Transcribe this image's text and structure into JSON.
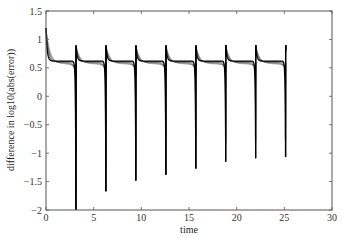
{
  "chart_data": {
    "type": "line",
    "title": "",
    "xlabel": "time",
    "ylabel": "difference in log10(abs(error))",
    "xlim": [
      0,
      30
    ],
    "ylim": [
      -2,
      1.5
    ],
    "xticks": [
      0,
      5,
      10,
      15,
      20,
      25,
      30
    ],
    "yticks": [
      -2,
      -1.5,
      -1,
      -0.5,
      0,
      0.5,
      1,
      1.5
    ],
    "xtick_labels": [
      "0",
      "5",
      "10",
      "15",
      "20",
      "25",
      "30"
    ],
    "ytick_labels": [
      "−2",
      "−1.5",
      "−1",
      "−0.5",
      "0",
      "0.5",
      "1",
      "1.5"
    ],
    "grid": false,
    "legend": null,
    "series_count": 6,
    "spike_times": [
      3.14,
      6.28,
      9.42,
      12.57,
      15.71,
      18.85,
      21.99,
      25.13
    ],
    "spike_minima": [
      -2.0,
      -1.67,
      -1.48,
      -1.38,
      -1.27,
      -1.15,
      -1.09,
      -1.07
    ],
    "rebound_peaks": [
      0.9,
      0.9,
      0.9,
      0.9,
      0.9,
      0.9,
      0.9,
      0.9
    ],
    "initial_peak": 1.2,
    "baseline": 0.6,
    "end_time": 25.2
  }
}
